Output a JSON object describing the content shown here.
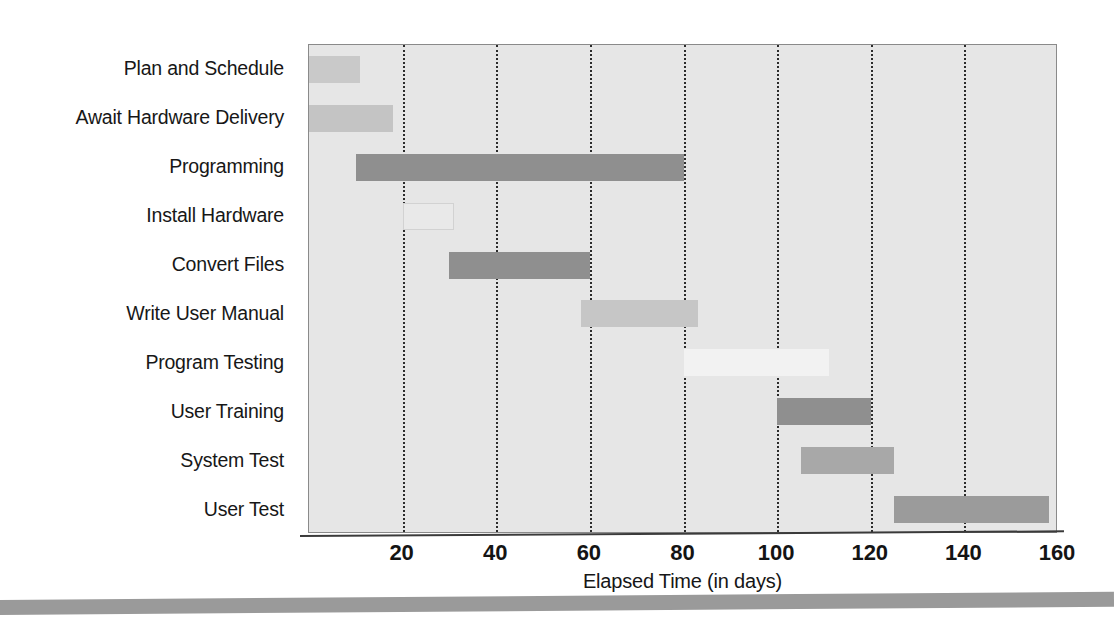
{
  "chart_data": {
    "type": "bar",
    "subtype": "gantt",
    "title": "",
    "xlabel": "Elapsed Time (in days)",
    "ylabel": "",
    "xlim": [
      0,
      160
    ],
    "xticks": [
      20,
      40,
      60,
      80,
      100,
      120,
      140,
      160
    ],
    "grid": true,
    "legend": "none",
    "plot_background": "#e6e6e6",
    "categories": [
      "Plan and Schedule",
      "Await Hardware Delivery",
      "Programming",
      "Install Hardware",
      "Convert Files",
      "Write User Manual",
      "Program Testing",
      "User Training",
      "System Test",
      "User Test"
    ],
    "tasks": [
      {
        "label": "Plan and Schedule",
        "start": 0,
        "end": 11,
        "duration": 11,
        "color": "#c9c9c9",
        "border": "#c9c9c9"
      },
      {
        "label": "Await Hardware Delivery",
        "start": 0,
        "end": 18,
        "duration": 18,
        "color": "#c4c4c4",
        "border": "#c4c4c4"
      },
      {
        "label": "Programming",
        "start": 10,
        "end": 80,
        "duration": 70,
        "color": "#8f8f8f",
        "border": "#8f8f8f"
      },
      {
        "label": "Install Hardware",
        "start": 20,
        "end": 31,
        "duration": 11,
        "color": "#e9e9e9",
        "border": "#d2d2d2"
      },
      {
        "label": "Convert Files",
        "start": 30,
        "end": 60,
        "duration": 30,
        "color": "#8f8f8f",
        "border": "#8f8f8f"
      },
      {
        "label": "Write User Manual",
        "start": 58,
        "end": 83,
        "duration": 25,
        "color": "#c6c6c6",
        "border": "#c6c6c6"
      },
      {
        "label": "Program Testing",
        "start": 80,
        "end": 111,
        "duration": 31,
        "color": "#f2f2f2",
        "border": "#f2f2f2"
      },
      {
        "label": "User Training",
        "start": 100,
        "end": 120,
        "duration": 20,
        "color": "#8f8f8f",
        "border": "#8f8f8f"
      },
      {
        "label": "System Test",
        "start": 105,
        "end": 125,
        "duration": 20,
        "color": "#a8a8a8",
        "border": "#a8a8a8"
      },
      {
        "label": "User Test",
        "start": 125,
        "end": 158,
        "duration": 33,
        "color": "#9b9b9b",
        "border": "#9b9b9b"
      }
    ]
  },
  "axis": {
    "x_title": "Elapsed Time (in days)",
    "tick_labels": [
      "20",
      "40",
      "60",
      "80",
      "100",
      "120",
      "140",
      "160"
    ]
  }
}
